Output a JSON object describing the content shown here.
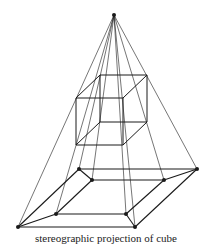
{
  "caption": "stereographic projection of cube",
  "colors": {
    "line": "#1a1a1a",
    "background": "#ffffff"
  },
  "apex": [
    114,
    15
  ],
  "cube": {
    "front": [
      [
        76,
        98
      ],
      [
        123,
        98
      ],
      [
        123,
        145
      ],
      [
        76,
        145
      ]
    ],
    "back": [
      [
        100,
        75
      ],
      [
        147,
        75
      ],
      [
        147,
        122
      ],
      [
        100,
        122
      ]
    ]
  },
  "outer_square": [
    [
      79,
      169
    ],
    [
      197,
      169
    ],
    [
      135,
      227
    ],
    [
      18,
      227
    ]
  ],
  "inner_square": [
    [
      92,
      180
    ],
    [
      164,
      180
    ],
    [
      126,
      214
    ],
    [
      56,
      214
    ]
  ]
}
